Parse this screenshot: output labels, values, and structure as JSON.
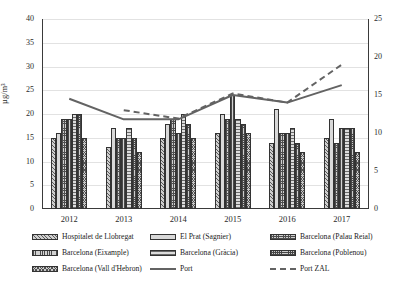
{
  "chart_data": {
    "type": "bar",
    "title": "",
    "xlabel": "",
    "ylabel": "µg/m³",
    "ylabel_right": "",
    "categories": [
      "2012",
      "2013",
      "2014",
      "2015",
      "2016",
      "2017"
    ],
    "ylim": [
      0,
      40
    ],
    "yticks": [
      0,
      5,
      10,
      15,
      20,
      25,
      30,
      35,
      40
    ],
    "ylim_right": [
      0,
      25
    ],
    "yticks_right": [
      0,
      5,
      10,
      15,
      20,
      25
    ],
    "grid": true,
    "legend_position": "bottom",
    "series": [
      {
        "name": "Hospitalet de Llobregat",
        "type": "bar",
        "axis": "left",
        "pattern": "diagonal-hatch",
        "values": [
          15,
          13,
          15,
          16,
          14,
          15
        ]
      },
      {
        "name": "El Prat (Sagnier)",
        "type": "bar",
        "axis": "left",
        "pattern": "solid-light",
        "values": [
          16,
          17,
          18,
          20,
          21,
          19
        ]
      },
      {
        "name": "Barcelona (Palau Reial)",
        "type": "bar",
        "axis": "left",
        "pattern": "cross-hatch",
        "values": [
          19,
          15,
          19,
          19,
          16,
          14
        ]
      },
      {
        "name": "Barcelona (Eixample)",
        "type": "bar",
        "axis": "left",
        "pattern": "vertical-hatch",
        "values": [
          19,
          15,
          16,
          24,
          16,
          17
        ]
      },
      {
        "name": "Barcelona (Gràcia)",
        "type": "bar",
        "axis": "left",
        "pattern": "horizontal-light",
        "values": [
          20,
          17,
          20,
          19,
          17,
          17
        ]
      },
      {
        "name": "Barcelona (Poblenou)",
        "type": "bar",
        "axis": "left",
        "pattern": "fine-cross-hatch",
        "values": [
          20,
          15,
          18,
          18,
          14,
          17
        ]
      },
      {
        "name": "Barcelona (Vall d'Hebron)",
        "type": "bar",
        "axis": "left",
        "pattern": "dense-cross-hatch",
        "values": [
          15,
          12,
          15,
          16,
          12,
          12
        ]
      },
      {
        "name": "Port",
        "type": "line",
        "axis": "right",
        "style": "solid",
        "values": [
          14.5,
          11.8,
          11.8,
          15.0,
          14.0,
          16.3
        ]
      },
      {
        "name": "Port ZAL",
        "type": "line",
        "axis": "right",
        "style": "dashed",
        "values": [
          null,
          13.0,
          11.9,
          15.2,
          14.0,
          19.0
        ]
      }
    ]
  },
  "legend": {
    "items": [
      {
        "label": "Hospitalet de Llobregat",
        "kind": "bar",
        "pattern": "diagonal-hatch"
      },
      {
        "label": "El Prat (Sagnier)",
        "kind": "bar",
        "pattern": "solid-light"
      },
      {
        "label": "Barcelona (Palau Reial)",
        "kind": "bar",
        "pattern": "cross-hatch"
      },
      {
        "label": "Barcelona (Eixample)",
        "kind": "bar",
        "pattern": "vertical-hatch"
      },
      {
        "label": "Barcelona (Gràcia)",
        "kind": "bar",
        "pattern": "horizontal-light"
      },
      {
        "label": "Barcelona (Poblenou)",
        "kind": "bar",
        "pattern": "fine-cross-hatch"
      },
      {
        "label": "Barcelona (Vall d'Hebron)",
        "kind": "bar",
        "pattern": "dense-cross-hatch"
      },
      {
        "label": "Port",
        "kind": "line-solid"
      },
      {
        "label": "Port ZAL",
        "kind": "line-dashed"
      }
    ]
  },
  "axes": {
    "left_ticks": [
      "40",
      "35",
      "30",
      "25",
      "20",
      "15",
      "10",
      "5",
      "0"
    ],
    "right_ticks": [
      "25",
      "20",
      "15",
      "10",
      "5",
      "0"
    ],
    "x_ticks": [
      "2012",
      "2013",
      "2014",
      "2015",
      "2016",
      "2017"
    ],
    "left_title": "µg/m³"
  },
  "colors": {
    "line": "#636363",
    "axis": "#3a3a3a",
    "grid": "#e2e2e2",
    "bar_border": "#333333",
    "text": "#1a1a1a"
  }
}
